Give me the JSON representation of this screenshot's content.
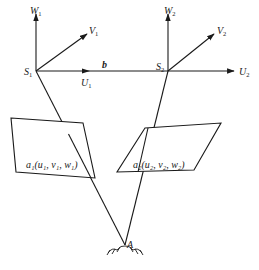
{
  "diagram": {
    "type": "stereo-photogrammetry-geometry",
    "stations": [
      {
        "name": "S1",
        "label_main": "S",
        "label_sub": "1",
        "axes": {
          "W": {
            "main": "W",
            "sub": "1"
          },
          "V": {
            "main": "V",
            "sub": "1"
          },
          "U": {
            "main": "U",
            "sub": "1"
          }
        }
      },
      {
        "name": "S2",
        "label_main": "S",
        "label_sub": "2",
        "axes": {
          "W": {
            "main": "W",
            "sub": "2"
          },
          "V": {
            "main": "V",
            "sub": "2"
          },
          "U": {
            "main": "U",
            "sub": "2"
          }
        }
      }
    ],
    "baseline": {
      "label": "b"
    },
    "image_points": [
      {
        "label": "a₁(u₁,  v₁,  w₁)"
      },
      {
        "label": "a₂(u₂,  v₂,  w₂)"
      }
    ],
    "ground_point": {
      "label": "A"
    },
    "colors": {
      "stroke": "#1a1a1a",
      "background": "#ffffff"
    }
  }
}
